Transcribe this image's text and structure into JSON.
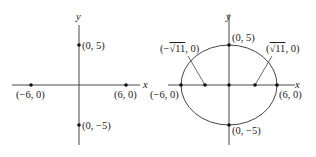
{
  "figure": {
    "left_panel": {
      "axis_labels": {
        "x": "x",
        "y": "y"
      },
      "points": [
        {
          "label": "(0, 5)",
          "x": 0,
          "y": 5
        },
        {
          "label": "(0, −5)",
          "x": 0,
          "y": -5
        },
        {
          "label": "(−6, 0)",
          "x": -6,
          "y": 0
        },
        {
          "label": "(6, 0)",
          "x": 6,
          "y": 0
        }
      ]
    },
    "right_panel": {
      "axis_labels": {
        "x": "x",
        "y": "y"
      },
      "curve": "ellipse",
      "semi_major_axis": 6,
      "semi_minor_axis": 5,
      "center_label": "",
      "points": [
        {
          "label": "(0, 5)",
          "x": 0,
          "y": 5
        },
        {
          "label": "(0, −5)",
          "x": 0,
          "y": -5
        },
        {
          "label": "(−6, 0)",
          "x": -6,
          "y": 0
        },
        {
          "label": "(6, 0)",
          "x": 6,
          "y": 0
        },
        {
          "label": "(0, 0)",
          "x": 0,
          "y": 0
        }
      ],
      "foci": [
        {
          "label_prefix": "(−",
          "radical": "√11",
          "label_suffix": ", 0)",
          "x": "-sqrt(11)",
          "y": 0
        },
        {
          "label_prefix": "(",
          "radical": "√11",
          "label_suffix": ", 0)",
          "x": "sqrt(11)",
          "y": 0
        }
      ]
    },
    "colors": {
      "ink": "#222222",
      "background": "#ffffff"
    }
  }
}
